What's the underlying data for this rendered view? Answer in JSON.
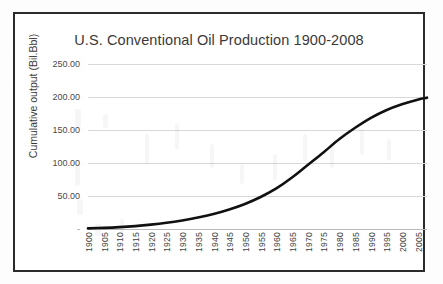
{
  "figure": {
    "title": "U.S. Conventional Oil Production 1900-2008",
    "border_color": "#2b2b2b",
    "background": "#ffffff"
  },
  "axes": {
    "y_title": "Cumulative output (Bil.Bbl)",
    "y_tick_labels": [
      "250.00",
      "200.00",
      "150.00",
      "100.00",
      "50.00",
      "-"
    ],
    "x_tick_labels": [
      "1900",
      "1905",
      "1910",
      "1915",
      "1920",
      "1925",
      "1930",
      "1935",
      "1940",
      "1945",
      "1950",
      "1955",
      "1960",
      "1965",
      "1970",
      "1975",
      "1980",
      "1985",
      "1990",
      "1995",
      "2000",
      "2005"
    ]
  },
  "colors": {
    "series_line": "#111111",
    "gridline": "#d8d8d8",
    "text": "#3a3a3a"
  },
  "chart_data": {
    "type": "line",
    "title": "U.S. Conventional Oil Production 1900-2008",
    "xlabel": "",
    "ylabel": "Cumulative output (Bil.Bbl)",
    "xlim": [
      1900,
      2008
    ],
    "ylim": [
      0,
      250
    ],
    "ytick_values": [
      0,
      50,
      100,
      150,
      200,
      250
    ],
    "ytick_format": "0.00 (zero shown as dash)",
    "xtick_values": [
      1900,
      1905,
      1910,
      1915,
      1920,
      1925,
      1930,
      1935,
      1940,
      1945,
      1950,
      1955,
      1960,
      1965,
      1970,
      1975,
      1980,
      1985,
      1990,
      1995,
      2000,
      2005
    ],
    "grid": "horizontal",
    "legend": "none",
    "series": [
      {
        "name": "Cumulative conventional oil output",
        "x": [
          1900,
          1905,
          1910,
          1915,
          1920,
          1925,
          1930,
          1935,
          1940,
          1945,
          1950,
          1955,
          1960,
          1965,
          1970,
          1975,
          1980,
          1985,
          1990,
          1995,
          2000,
          2005,
          2008
        ],
        "values": [
          1.0,
          1.7,
          2.8,
          4.4,
          6.6,
          9.4,
          13.0,
          17.4,
          22.8,
          29.6,
          38.0,
          48.5,
          61.5,
          78.0,
          97.0,
          116.0,
          136.0,
          153.0,
          168.0,
          180.0,
          189.0,
          196.0,
          199.0
        ]
      }
    ]
  }
}
